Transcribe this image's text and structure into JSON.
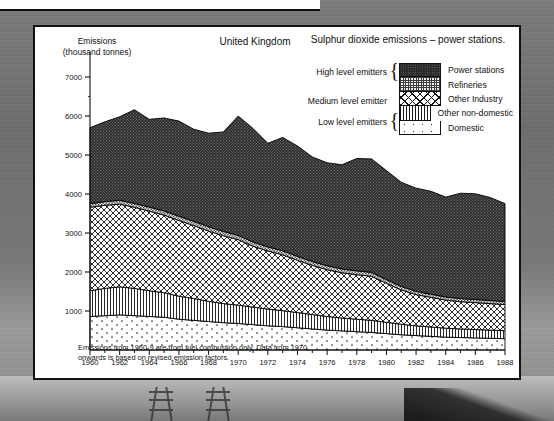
{
  "card": {
    "y_axis_title": "Emissions\n(thousand tonnes)",
    "y_axis_title_line1": "Emissions",
    "y_axis_title_line2": "(thousand tonnes)",
    "region_title": "United Kingdom",
    "main_title": "Sulphur dioxide emissions – power stations.",
    "footnote": "Emissions from 1960-9 are from fuel combustion only. Data from 1970 onwards is based on revised emission factors."
  },
  "legend": {
    "groups": [
      {
        "label": "High level emitters",
        "rows": 2
      },
      {
        "label": "Medium level emitter",
        "rows": 1
      },
      {
        "label": "Low level emitters",
        "rows": 2
      }
    ],
    "entries": [
      {
        "label": "Power stations",
        "pattern": "dark-stipple",
        "color": "#2b2b2b"
      },
      {
        "label": "Refineries",
        "pattern": "fine-checker",
        "color": "#8a8a8a"
      },
      {
        "label": "Other Industry",
        "pattern": "diagonal-cross",
        "color": "#ffffff"
      },
      {
        "label": "Other non-domestic",
        "pattern": "vertical-lines",
        "color": "#ffffff"
      },
      {
        "label": "Domestic",
        "pattern": "sparse-dots",
        "color": "#ffffff"
      }
    ]
  },
  "chart_data": {
    "type": "area",
    "stacked": true,
    "title": "Sulphur dioxide emissions – power stations.",
    "subtitle": "United Kingdom",
    "xlabel": "",
    "ylabel": "Emissions (thousand tonnes)",
    "ylim": [
      0,
      7000
    ],
    "xlim": [
      1960,
      1988
    ],
    "ytick_step": 1000,
    "yticks": [
      1000,
      2000,
      3000,
      4000,
      5000,
      6000,
      7000
    ],
    "xticks": [
      1960,
      1962,
      1964,
      1966,
      1968,
      1970,
      1972,
      1974,
      1976,
      1978,
      1980,
      1982,
      1984,
      1986,
      1988
    ],
    "x_minor_step": 1,
    "grid": false,
    "legend_position": "top-right",
    "x": [
      1960,
      1961,
      1962,
      1963,
      1964,
      1965,
      1966,
      1967,
      1968,
      1969,
      1970,
      1971,
      1972,
      1973,
      1974,
      1975,
      1976,
      1977,
      1978,
      1979,
      1980,
      1981,
      1982,
      1983,
      1984,
      1985,
      1986,
      1987,
      1988
    ],
    "series": [
      {
        "name": "Domestic",
        "values": [
          860,
          880,
          900,
          880,
          860,
          840,
          790,
          760,
          730,
          700,
          680,
          650,
          620,
          600,
          570,
          540,
          510,
          490,
          470,
          450,
          420,
          390,
          370,
          350,
          330,
          320,
          310,
          300,
          290
        ]
      },
      {
        "name": "Other non-domestic",
        "values": [
          660,
          700,
          720,
          700,
          660,
          630,
          590,
          560,
          520,
          490,
          470,
          450,
          430,
          410,
          390,
          370,
          350,
          330,
          320,
          310,
          290,
          270,
          250,
          240,
          230,
          220,
          215,
          210,
          205
        ]
      },
      {
        "name": "Other Industry",
        "values": [
          2140,
          2130,
          2120,
          2080,
          2040,
          1990,
          1940,
          1870,
          1800,
          1740,
          1680,
          1560,
          1490,
          1430,
          1340,
          1260,
          1200,
          1160,
          1140,
          1130,
          1000,
          880,
          800,
          760,
          720,
          700,
          690,
          680,
          670
        ]
      },
      {
        "name": "Refineries",
        "values": [
          90,
          95,
          100,
          100,
          105,
          105,
          110,
          110,
          110,
          110,
          110,
          110,
          105,
          105,
          100,
          100,
          100,
          100,
          100,
          100,
          95,
          90,
          85,
          80,
          80,
          80,
          80,
          80,
          80
        ]
      },
      {
        "name": "Power stations",
        "values": [
          1950,
          2045,
          2140,
          2400,
          2250,
          2385,
          2440,
          2360,
          2400,
          2550,
          3060,
          2910,
          2655,
          2905,
          2830,
          2680,
          2640,
          2670,
          2880,
          2910,
          2795,
          2670,
          2645,
          2640,
          2560,
          2700,
          2710,
          2640,
          2510
        ]
      }
    ],
    "totals": [
      5700,
      5850,
      5980,
      6160,
      5915,
      5950,
      5870,
      5660,
      5560,
      5590,
      6000,
      5680,
      5300,
      5450,
      5230,
      4950,
      4800,
      4750,
      4910,
      4900,
      4600,
      4300,
      4150,
      4070,
      3920,
      4020,
      4005,
      3910,
      3755
    ],
    "series_order_bottom_to_top": [
      "Domestic",
      "Other non-domestic",
      "Other Industry",
      "Refineries",
      "Power stations"
    ]
  }
}
